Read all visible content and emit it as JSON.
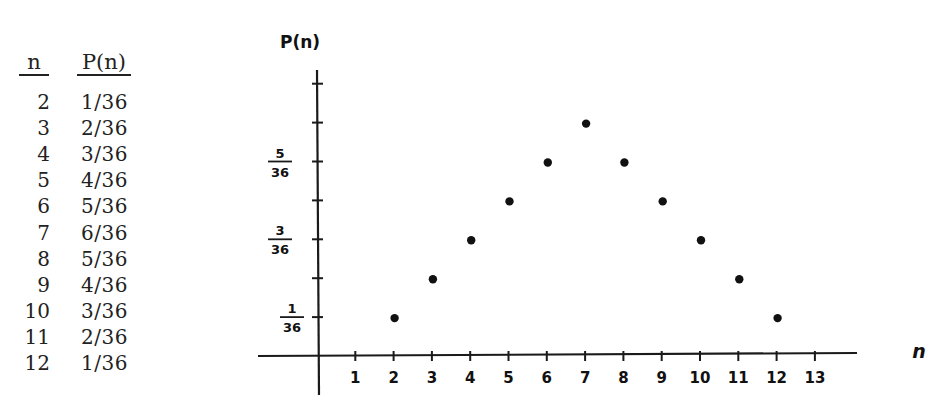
{
  "table": {
    "headers": {
      "n": "n",
      "p": "P(n)"
    },
    "rows": [
      {
        "n": "2",
        "p": "1/36"
      },
      {
        "n": "3",
        "p": "2/36"
      },
      {
        "n": "4",
        "p": "3/36"
      },
      {
        "n": "5",
        "p": "4/36"
      },
      {
        "n": "6",
        "p": "5/36"
      },
      {
        "n": "7",
        "p": "6/36"
      },
      {
        "n": "8",
        "p": "5/36"
      },
      {
        "n": "9",
        "p": "4/36"
      },
      {
        "n": "10",
        "p": "3/36"
      },
      {
        "n": "11",
        "p": "2/36"
      },
      {
        "n": "12",
        "p": "1/36"
      }
    ]
  },
  "chart_data": {
    "type": "scatter",
    "title": "",
    "xlabel": "n",
    "ylabel": "P(n)",
    "x": [
      2,
      3,
      4,
      5,
      6,
      7,
      8,
      9,
      10,
      11,
      12
    ],
    "y": [
      0.02778,
      0.05556,
      0.08333,
      0.11111,
      0.13889,
      0.16667,
      0.13889,
      0.11111,
      0.08333,
      0.05556,
      0.02778
    ],
    "y_fraction_labels": [
      "1/36",
      "2/36",
      "3/36",
      "4/36",
      "5/36",
      "6/36",
      "5/36",
      "4/36",
      "3/36",
      "2/36",
      "1/36"
    ],
    "x_ticks": [
      "1",
      "2",
      "3",
      "4",
      "5",
      "6",
      "7",
      "8",
      "9",
      "10",
      "11",
      "12",
      "13"
    ],
    "y_ticks": [
      {
        "num": "1",
        "den": "36",
        "value": 1
      },
      {
        "num": "3",
        "den": "36",
        "value": 3
      },
      {
        "num": "5",
        "den": "36",
        "value": 5
      }
    ],
    "y_tick_count": 7,
    "xlim": [
      0,
      14
    ],
    "ylim_36ths": [
      0,
      7
    ],
    "grid": false,
    "legend": null,
    "style": "hand-drawn"
  }
}
